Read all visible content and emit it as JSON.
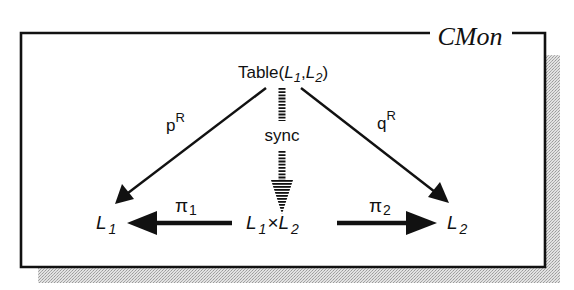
{
  "diagram": {
    "frame_title": "CMon",
    "nodes": {
      "table": {
        "prefix": "Table(",
        "arg1_base": "L",
        "arg1_sub": "1",
        "sep": ",",
        "arg2_base": "L",
        "arg2_sub": "2",
        "suffix": ")"
      },
      "left": {
        "base": "L",
        "sub": "1"
      },
      "product": {
        "left_base": "L",
        "left_sub": "1",
        "op": "×",
        "right_base": "L",
        "right_sub": "2"
      },
      "right": {
        "base": "L",
        "sub": "2"
      }
    },
    "edges": {
      "p_r": {
        "base": "p",
        "sup": "R",
        "from": "Table(L1,L2)",
        "to": "L1"
      },
      "q_r": {
        "base": "q",
        "sup": "R",
        "from": "Table(L1,L2)",
        "to": "L2"
      },
      "sync": {
        "label": "sync",
        "from": "Table(L1,L2)",
        "to": "L1×L2",
        "style": "dashed"
      },
      "pi_1": {
        "base": "π",
        "sub": "1",
        "from": "L1×L2",
        "to": "L1"
      },
      "pi_2": {
        "base": "π",
        "sub": "2",
        "from": "L1×L2",
        "to": "L2"
      }
    },
    "colors": {
      "ink": "#111111",
      "shadow": "#bdbdbd",
      "background": "#ffffff"
    }
  }
}
